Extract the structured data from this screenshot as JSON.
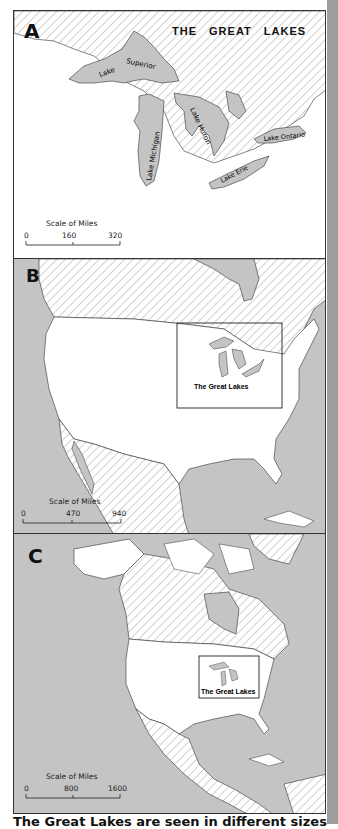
{
  "panels": [
    {
      "letter": "A",
      "title": "THE GREAT LAKES",
      "lake_labels": [
        "Lake Superior",
        "Lake Michigan",
        "Lake Huron",
        "Lake Erie",
        "Lake Ontario"
      ],
      "scale": {
        "title": "Scale of Miles",
        "ticks": [
          "0",
          "160",
          "320"
        ]
      }
    },
    {
      "letter": "B",
      "inset_label": "The Great Lakes",
      "scale": {
        "title": "Scale of Miles",
        "ticks": [
          "0",
          "470",
          "940"
        ]
      }
    },
    {
      "letter": "C",
      "inset_label": "The Great Lakes",
      "scale": {
        "title": "Scale of Miles",
        "ticks": [
          "0",
          "800",
          "1600"
        ]
      }
    }
  ],
  "caption": "The Great Lakes are seen in different sizes",
  "colors": {
    "water": "#c4c4c4",
    "land_us": "#ffffff",
    "hatch": "#9a9a9a",
    "border": "#333333",
    "side_strip": "#9d9d9d"
  }
}
